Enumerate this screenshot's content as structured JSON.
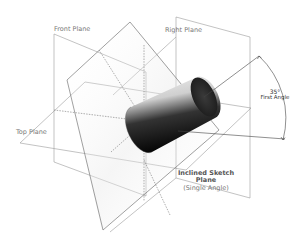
{
  "labels": {
    "front_plane": "Front Plane",
    "right_plane": "Right Plane",
    "top_plane": "Top Plane",
    "angle_value": "35°",
    "angle_name": "First Angle",
    "inclined_line1": "Inclined Sketch",
    "inclined_line2": "Plane",
    "inclined_line3": "(Single Angle)"
  },
  "colors": {
    "plane_line": "#8a8a8a",
    "inclined_line": "#6a6a6a",
    "dimension_line": "#444444",
    "cylinder_dark": "#111111",
    "cylinder_light": "#f2f2f2"
  }
}
